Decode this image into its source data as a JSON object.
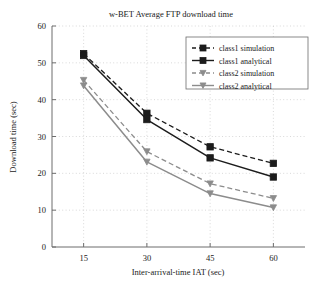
{
  "chart_data": {
    "type": "line",
    "title": "w-BET Average FTP download time",
    "xlabel": "Inter-arrival-time IAT (sec)",
    "ylabel": "Download time (sec)",
    "x": [
      15,
      30,
      45,
      60
    ],
    "xticklabels": [
      "15",
      "30",
      "45",
      "60"
    ],
    "yticklabels": [
      "0",
      "10",
      "20",
      "30",
      "40",
      "50",
      "60"
    ],
    "xlim": [
      7.5,
      67.5
    ],
    "ylim": [
      0,
      60
    ],
    "grid": true,
    "legend_position": "upper right",
    "series": [
      {
        "name": "class1 simulation",
        "values": [
          52.5,
          36.3,
          27.2,
          22.7
        ],
        "color": "#1c1c1c",
        "style": "dashed",
        "marker": "square"
      },
      {
        "name": "class1 analytical",
        "values": [
          52.0,
          34.6,
          24.2,
          19.0
        ],
        "color": "#1c1c1c",
        "style": "solid",
        "marker": "square"
      },
      {
        "name": "class2 simulation",
        "values": [
          45.3,
          25.9,
          17.2,
          13.2
        ],
        "color": "#8c8c8c",
        "style": "dashed",
        "marker": "triangle-down"
      },
      {
        "name": "class2 analytical",
        "values": [
          43.8,
          23.1,
          14.5,
          10.7
        ],
        "color": "#8c8c8c",
        "style": "solid",
        "marker": "triangle-down"
      }
    ]
  },
  "axis": {
    "line_color": "#6d6d6d",
    "grid_color": "#c8c8c8"
  }
}
